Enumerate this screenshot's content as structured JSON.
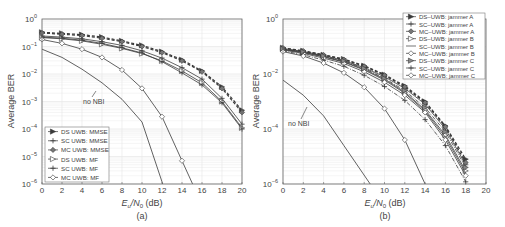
{
  "chart_data": [
    {
      "type": "line",
      "panel_label": "(a)",
      "title": "",
      "xlabel": "E_u/N_0 (dB)",
      "ylabel": "Average BER",
      "yscale": "log",
      "xlim": [
        0,
        20
      ],
      "ylim": [
        1e-06,
        1
      ],
      "xticks": [
        0,
        2,
        4,
        6,
        8,
        10,
        12,
        14,
        16,
        18,
        20
      ],
      "yticks": [
        "10^0",
        "10^-1",
        "10^-2",
        "10^-3",
        "10^-4",
        "10^-5",
        "10^-6"
      ],
      "grid": true,
      "legend_position": "lower left",
      "annotation": "no NBI",
      "x": [
        0,
        2,
        4,
        6,
        8,
        10,
        12,
        14,
        16,
        18,
        20
      ],
      "series": [
        {
          "name": "DS UWB: MMSE",
          "marker": "triangle-right-filled",
          "dash": "dashed",
          "values": [
            0.33,
            0.3,
            0.27,
            0.22,
            0.16,
            0.11,
            0.065,
            0.033,
            0.013,
            0.0034,
            0.00048
          ]
        },
        {
          "name": "SC UWB: MMSE",
          "marker": "plus",
          "dash": "solid",
          "values": [
            0.24,
            0.22,
            0.19,
            0.15,
            0.11,
            0.07,
            0.038,
            0.017,
            0.0065,
            0.0013,
            0.00015
          ]
        },
        {
          "name": "MC UWB: MMSE",
          "marker": "diamond-filled",
          "dash": "dashed",
          "values": [
            0.31,
            0.28,
            0.25,
            0.2,
            0.15,
            0.1,
            0.06,
            0.03,
            0.012,
            0.003,
            0.0004
          ]
        },
        {
          "name": "DS UWB: MF",
          "marker": "triangle-right",
          "dash": "solid",
          "values": [
            0.21,
            0.19,
            0.16,
            0.12,
            0.085,
            0.055,
            0.03,
            0.013,
            0.0048,
            0.001,
            0.00011
          ]
        },
        {
          "name": "SC UWB: MF",
          "marker": "plus",
          "dash": "solid",
          "values": [
            0.22,
            0.2,
            0.17,
            0.13,
            0.09,
            0.058,
            0.028,
            0.011,
            0.004,
            0.0009,
            0.0001
          ]
        },
        {
          "name": "MC UWB: MF",
          "marker": "diamond",
          "dash": "solid",
          "values": [
            0.18,
            0.13,
            0.08,
            0.04,
            0.014,
            0.003,
            0.00028,
            7e-06,
            null,
            null,
            null
          ]
        },
        {
          "name": "no NBI",
          "marker": "none",
          "dash": "solid",
          "values": [
            0.08,
            0.04,
            0.015,
            0.0048,
            0.0012,
            0.00018,
            1.2e-06,
            null,
            null,
            null,
            null
          ]
        }
      ]
    },
    {
      "type": "line",
      "panel_label": "(b)",
      "title": "",
      "xlabel": "E_u/N_0 (dB)",
      "ylabel": "Average BER",
      "yscale": "log",
      "xlim": [
        0,
        20
      ],
      "ylim": [
        1e-06,
        1
      ],
      "xticks": [
        0,
        2,
        4,
        6,
        8,
        10,
        12,
        14,
        16,
        18,
        20
      ],
      "yticks": [
        "10^0",
        "10^-2",
        "10^-4",
        "10^-6"
      ],
      "grid": true,
      "legend_position": "upper right",
      "annotation": "no NBI",
      "x": [
        0,
        2,
        4,
        6,
        8,
        10,
        12,
        14,
        16,
        18
      ],
      "series": [
        {
          "name": "DS–UWB: jammer A",
          "marker": "triangle-right-filled",
          "dash": "dashed",
          "values": [
            0.09,
            0.07,
            0.05,
            0.035,
            0.02,
            0.0095,
            0.0037,
            0.001,
            0.00013,
            8e-06
          ]
        },
        {
          "name": "SC–UWB: jammer A",
          "marker": "plus",
          "dash": "solid",
          "values": [
            0.085,
            0.066,
            0.047,
            0.031,
            0.017,
            0.008,
            0.003,
            0.0008,
            0.0001,
            5e-06
          ]
        },
        {
          "name": "MC–UWB: jammer A",
          "marker": "diamond-filled",
          "dash": "dashed",
          "values": [
            0.088,
            0.068,
            0.049,
            0.033,
            0.019,
            0.009,
            0.0034,
            0.0009,
            0.00012,
            6e-06
          ]
        },
        {
          "name": "DS–UWB: jammer B",
          "marker": "triangle-right",
          "dash": "solid",
          "values": [
            0.08,
            0.062,
            0.043,
            0.028,
            0.015,
            0.0065,
            0.0022,
            0.0005,
            6e-05,
            3e-06
          ]
        },
        {
          "name": "SC–UWB: jammer B",
          "marker": "none",
          "dash": "solid",
          "values": [
            0.078,
            0.06,
            0.042,
            0.027,
            0.014,
            0.006,
            0.002,
            0.00045,
            5e-05,
            2.5e-06
          ]
        },
        {
          "name": "MC–UWB: jammer B",
          "marker": "diamond",
          "dash": "solid",
          "values": [
            0.075,
            0.056,
            0.038,
            0.024,
            0.012,
            0.005,
            0.0017,
            0.0004,
            4e-05,
            2e-06
          ]
        },
        {
          "name": "DS–UWB: jammer C",
          "marker": "triangle-right-half",
          "dash": "dashdot",
          "values": [
            0.082,
            0.064,
            0.045,
            0.03,
            0.016,
            0.007,
            0.0025,
            0.0006,
            8e-05,
            4e-06
          ]
        },
        {
          "name": "SC–UWB: jammer C",
          "marker": "plus",
          "dash": "dashdot",
          "values": [
            0.07,
            0.05,
            0.032,
            0.019,
            0.009,
            0.0035,
            0.0011,
            0.00022,
            2.5e-05,
            1.2e-06
          ]
        },
        {
          "name": "MC–UWB: jammer C",
          "marker": "diamond",
          "dash": "solid",
          "values": [
            0.065,
            0.045,
            0.025,
            0.011,
            0.0033,
            0.00055,
            4e-05,
            9e-07,
            null,
            null
          ]
        },
        {
          "name": "no NBI",
          "marker": "none",
          "dash": "solid",
          "values": [
            0.006,
            0.0017,
            0.0003,
            2.5e-05,
            null,
            null,
            null,
            null,
            null,
            null
          ]
        }
      ]
    }
  ],
  "labels": {
    "a": {
      "ylabel": "Average BER",
      "xlabel_main": "E",
      "xlabel_sub1": "u",
      "xlabel_mid": "/N",
      "xlabel_sub2": "0",
      "xlabel_unit": " (dB)",
      "panel": "(a)",
      "annotation": "no NBI",
      "legend": [
        "DS UWB: MMSE",
        "SC UWB: MMSE",
        "MC UWB: MMSE",
        "DS UWB: MF",
        "SC UWB: MF",
        "MC UWB: MF"
      ]
    },
    "b": {
      "ylabel": "Average BER",
      "xlabel_main": "E",
      "xlabel_sub1": "u",
      "xlabel_mid": "/N",
      "xlabel_sub2": "0",
      "xlabel_unit": " (dB)",
      "panel": "(b)",
      "annotation": "no NBI",
      "legend": [
        "DS–UWB: jammer A",
        "SC–UWB: jammer A",
        "MC–UWB: jammer A",
        "DS–UWB: jammer B",
        "SC–UWB: jammer B",
        "MC–UWB: jammer B",
        "DS–UWB: jammer C",
        "SC–UWB: jammer C",
        "MC–UWB: jammer C"
      ]
    }
  },
  "colors": {
    "line": "#3a3a3a",
    "grid": "#e6e6e6",
    "axis": "#555555",
    "text": "#444444"
  }
}
